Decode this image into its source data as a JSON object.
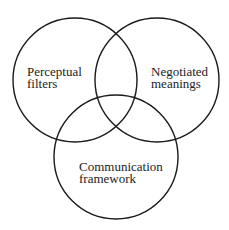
{
  "diagram": {
    "type": "venn",
    "stroke_color": "#1a1a1a",
    "text_color": "#222222",
    "circles": [
      {
        "id": "perceptual-filters",
        "cx": 75,
        "cy": 80,
        "r": 62,
        "label_lines": [
          "Perceptual",
          "filters"
        ],
        "label_x": 27,
        "label_y": [
          76,
          88
        ]
      },
      {
        "id": "negotiated-meanings",
        "cx": 157,
        "cy": 80,
        "r": 62,
        "label_lines": [
          "Negotiated",
          "meanings"
        ],
        "label_x": 151,
        "label_y": [
          76,
          88
        ]
      },
      {
        "id": "communication-framework",
        "cx": 116,
        "cy": 157,
        "r": 62,
        "label_lines": [
          "Communication",
          "framework"
        ],
        "label_x": 79,
        "label_y": [
          171,
          183
        ]
      }
    ]
  }
}
